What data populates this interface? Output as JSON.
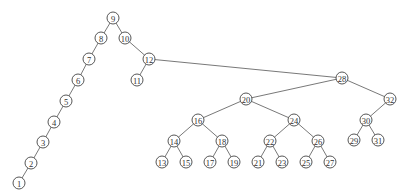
{
  "diagram": {
    "type": "binary-search-tree",
    "node_radius": 6,
    "colors": {
      "background": "#ffffff",
      "stroke": "#444444",
      "edge": "#555555",
      "text": "#333333"
    },
    "nodes": [
      {
        "id": "9",
        "label": "9",
        "x": 113,
        "y": 18
      },
      {
        "id": "8",
        "label": "8",
        "x": 101,
        "y": 38
      },
      {
        "id": "10",
        "label": "10",
        "x": 125,
        "y": 38
      },
      {
        "id": "7",
        "label": "7",
        "x": 89,
        "y": 59
      },
      {
        "id": "12",
        "label": "12",
        "x": 149,
        "y": 59
      },
      {
        "id": "6",
        "label": "6",
        "x": 78,
        "y": 80
      },
      {
        "id": "11",
        "label": "11",
        "x": 137,
        "y": 80
      },
      {
        "id": "5",
        "label": "5",
        "x": 66,
        "y": 101
      },
      {
        "id": "4",
        "label": "4",
        "x": 54,
        "y": 122
      },
      {
        "id": "3",
        "label": "3",
        "x": 43,
        "y": 142
      },
      {
        "id": "2",
        "label": "2",
        "x": 31,
        "y": 163
      },
      {
        "id": "1",
        "label": "1",
        "x": 19,
        "y": 183
      },
      {
        "id": "28",
        "label": "28",
        "x": 342,
        "y": 78
      },
      {
        "id": "20",
        "label": "20",
        "x": 246,
        "y": 99
      },
      {
        "id": "32",
        "label": "32",
        "x": 390,
        "y": 99
      },
      {
        "id": "16",
        "label": "16",
        "x": 198,
        "y": 120
      },
      {
        "id": "24",
        "label": "24",
        "x": 294,
        "y": 120
      },
      {
        "id": "30",
        "label": "30",
        "x": 366,
        "y": 120
      },
      {
        "id": "14",
        "label": "14",
        "x": 174,
        "y": 141
      },
      {
        "id": "18",
        "label": "18",
        "x": 222,
        "y": 141
      },
      {
        "id": "22",
        "label": "22",
        "x": 270,
        "y": 141
      },
      {
        "id": "26",
        "label": "26",
        "x": 318,
        "y": 141
      },
      {
        "id": "29",
        "label": "29",
        "x": 354,
        "y": 140
      },
      {
        "id": "31",
        "label": "31",
        "x": 378,
        "y": 140
      },
      {
        "id": "13",
        "label": "13",
        "x": 162,
        "y": 162
      },
      {
        "id": "15",
        "label": "15",
        "x": 186,
        "y": 162
      },
      {
        "id": "17",
        "label": "17",
        "x": 210,
        "y": 162
      },
      {
        "id": "19",
        "label": "19",
        "x": 234,
        "y": 162
      },
      {
        "id": "21",
        "label": "21",
        "x": 258,
        "y": 162
      },
      {
        "id": "23",
        "label": "23",
        "x": 282,
        "y": 162
      },
      {
        "id": "25",
        "label": "25",
        "x": 306,
        "y": 162
      },
      {
        "id": "27",
        "label": "27",
        "x": 330,
        "y": 162
      }
    ],
    "edges": [
      [
        "9",
        "8"
      ],
      [
        "9",
        "10"
      ],
      [
        "8",
        "7"
      ],
      [
        "7",
        "6"
      ],
      [
        "6",
        "5"
      ],
      [
        "5",
        "4"
      ],
      [
        "4",
        "3"
      ],
      [
        "3",
        "2"
      ],
      [
        "2",
        "1"
      ],
      [
        "10",
        "12"
      ],
      [
        "12",
        "11"
      ],
      [
        "12",
        "28"
      ],
      [
        "28",
        "20"
      ],
      [
        "28",
        "32"
      ],
      [
        "20",
        "16"
      ],
      [
        "20",
        "24"
      ],
      [
        "16",
        "14"
      ],
      [
        "16",
        "18"
      ],
      [
        "14",
        "13"
      ],
      [
        "14",
        "15"
      ],
      [
        "18",
        "17"
      ],
      [
        "18",
        "19"
      ],
      [
        "24",
        "22"
      ],
      [
        "24",
        "26"
      ],
      [
        "22",
        "21"
      ],
      [
        "22",
        "23"
      ],
      [
        "26",
        "25"
      ],
      [
        "26",
        "27"
      ],
      [
        "32",
        "30"
      ],
      [
        "30",
        "29"
      ],
      [
        "30",
        "31"
      ]
    ]
  }
}
